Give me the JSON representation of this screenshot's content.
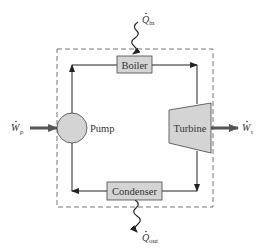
{
  "diagram": {
    "components": {
      "boiler": "Boiler",
      "turbine": "Turbine",
      "condenser": "Condenser",
      "pump": "Pump"
    },
    "energy_labels": {
      "q_in": {
        "symbol": "Q",
        "subscript": "in"
      },
      "q_out": {
        "symbol": "Q",
        "subscript": "out"
      },
      "w_p": {
        "symbol": "W",
        "subscript": "p"
      },
      "w_t": {
        "symbol": "W",
        "subscript": "t"
      }
    },
    "colors": {
      "component_fill": "#d4d4d4",
      "line": "#222222",
      "arrow_thick": "#555555",
      "boundary": "#777777"
    }
  }
}
